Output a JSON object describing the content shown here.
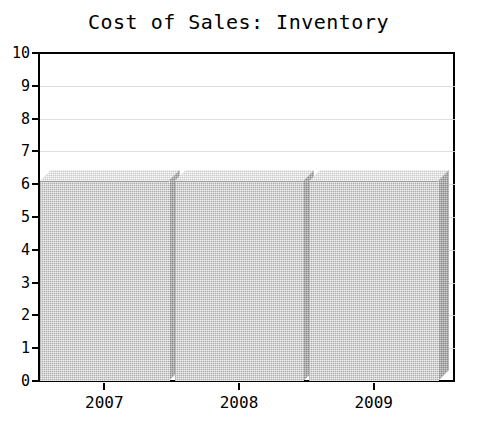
{
  "chart_data": {
    "type": "bar",
    "title": "Cost of Sales: Inventory",
    "xlabel": "",
    "ylabel": "",
    "categories": [
      "2007",
      "2008",
      "2009"
    ],
    "values": [
      6.1,
      6.1,
      6.1
    ],
    "ylim": [
      0,
      10
    ],
    "ytick_labels": [
      "0",
      "1",
      "2",
      "3",
      "4",
      "5",
      "6",
      "7",
      "8",
      "9",
      "10"
    ],
    "ytick_values": [
      0,
      1,
      2,
      3,
      4,
      5,
      6,
      7,
      8,
      9,
      10
    ],
    "grid": true,
    "legend": "none",
    "style": "3d-bar",
    "colors": {
      "bar_front": "#aeaeae",
      "bar_side": "#8a8a8a",
      "bar_top": "#cacaca",
      "axis": "#000000",
      "grid": "#d8d8d8",
      "background": "#ffffff"
    }
  }
}
